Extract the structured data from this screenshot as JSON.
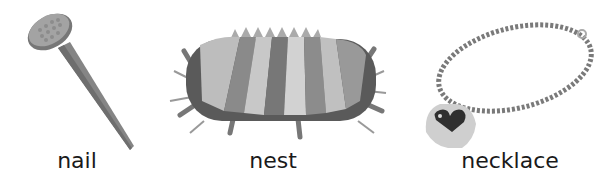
{
  "items": [
    {
      "label": "nail",
      "icon": "nail-icon"
    },
    {
      "label": "nest",
      "icon": "nest-icon"
    },
    {
      "label": "necklace",
      "icon": "necklace-icon"
    }
  ],
  "colors": {
    "background": "#ffffff",
    "text": "#1a1a1a",
    "metal": "#8a8a8a",
    "dark": "#3a3a3a",
    "light": "#c8c8c8"
  }
}
